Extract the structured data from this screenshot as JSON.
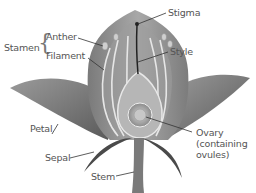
{
  "diagram": {
    "type": "flower-anatomy",
    "labels": {
      "stamen": "Stamen",
      "anther": "Anther",
      "filament": "Filament",
      "stigma": "Stigma",
      "style": "Style",
      "petal": "Petal",
      "ovary_line1": "Ovary",
      "ovary_line2": "(containing",
      "ovary_line3": "ovules)",
      "sepal": "Sepal",
      "stem": "Stem"
    }
  }
}
